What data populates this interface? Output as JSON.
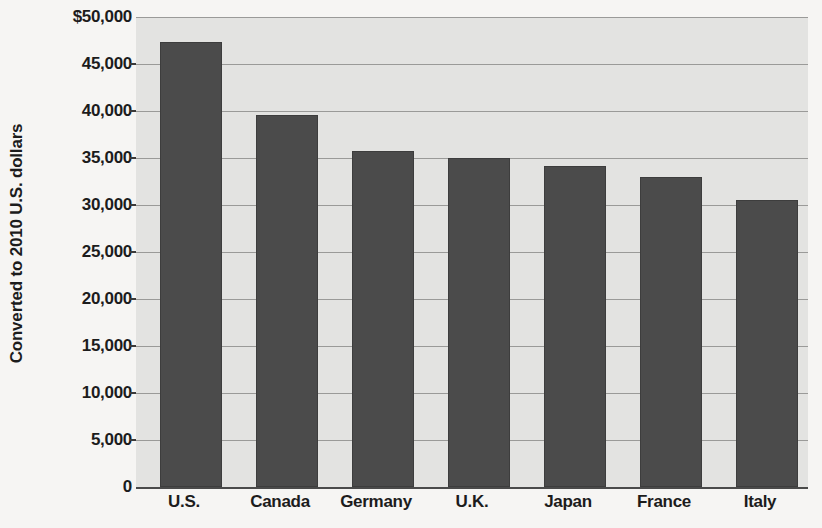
{
  "chart_data": {
    "type": "bar",
    "title": "",
    "xlabel": "",
    "ylabel": "Converted to 2010 U.S. dollars",
    "categories": [
      "U.S.",
      "Canada",
      "Germany",
      "U.K.",
      "Japan",
      "France",
      "Italy"
    ],
    "values": [
      47300,
      39600,
      35700,
      35000,
      34100,
      33000,
      30500
    ],
    "ylim": [
      0,
      50000
    ],
    "ytick_values": [
      0,
      5000,
      10000,
      15000,
      20000,
      25000,
      30000,
      35000,
      40000,
      45000,
      50000
    ],
    "ytick_labels": [
      "0",
      "5,000",
      "10,000",
      "15,000",
      "20,000",
      "25,000",
      "30,000",
      "35,000",
      "40,000",
      "45,000",
      "$50,000"
    ],
    "grid": true,
    "legend": false,
    "colors": {
      "bar_fill": "#4b4b4b",
      "bar_edge": "#3d3d3d",
      "plot_background": "#e3e3e1",
      "page_background": "#f6f5f3",
      "gridline": "#9a9a98",
      "axis": "#4a4a4a",
      "text": "#1c1c1c"
    }
  }
}
